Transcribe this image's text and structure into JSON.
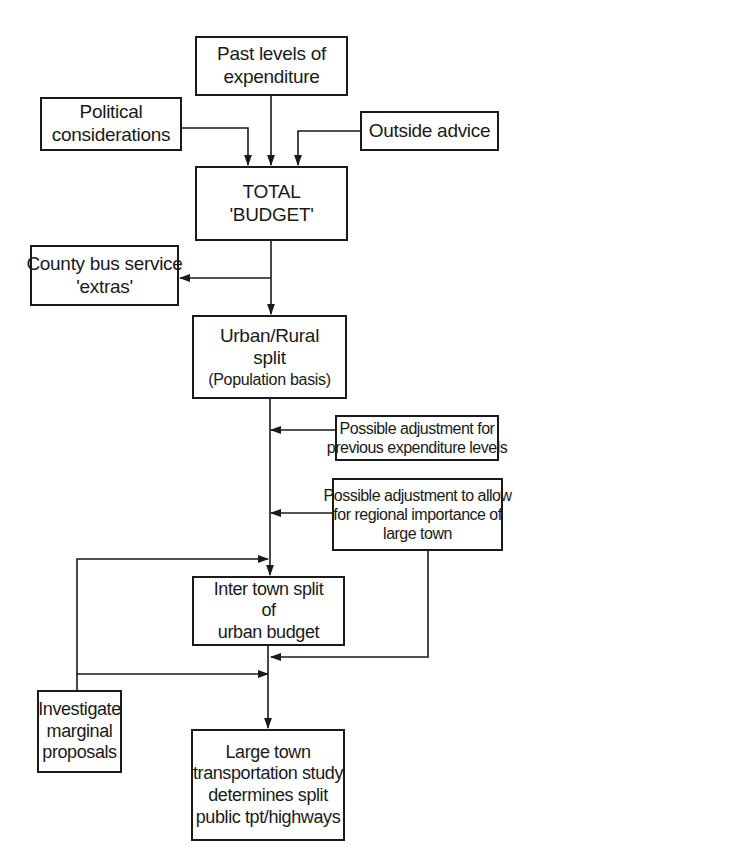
{
  "diagram": {
    "type": "flowchart",
    "nodes": {
      "past_levels": {
        "lines": [
          "Past levels of",
          "expenditure"
        ]
      },
      "political": {
        "lines": [
          "Political",
          "considerations"
        ]
      },
      "outside_advice": {
        "lines": [
          "Outside advice"
        ]
      },
      "total_budget": {
        "lines": [
          "TOTAL",
          "'BUDGET'"
        ]
      },
      "county_bus": {
        "lines": [
          "County bus service",
          "'extras'"
        ]
      },
      "urban_rural": {
        "lines": [
          "Urban/Rural",
          "split",
          "(Population basis)"
        ]
      },
      "adj_previous": {
        "lines": [
          "Possible adjustment for",
          "previous expenditure levels"
        ]
      },
      "adj_regional": {
        "lines": [
          "Possible adjustment to allow",
          "for regional importance of",
          "large town"
        ]
      },
      "inter_town": {
        "lines": [
          "Inter town split",
          "of",
          "urban budget"
        ]
      },
      "investigate": {
        "lines": [
          "Investigate",
          "marginal",
          "proposals"
        ]
      },
      "large_town": {
        "lines": [
          "Large town",
          "transportation study",
          "determines split",
          "public tpt/highways"
        ]
      }
    },
    "edges": [
      {
        "from": "past_levels",
        "to": "total_budget"
      },
      {
        "from": "political",
        "to": "total_budget"
      },
      {
        "from": "outside_advice",
        "to": "total_budget"
      },
      {
        "from": "total_budget",
        "to": "county_bus"
      },
      {
        "from": "total_budget",
        "to": "urban_rural"
      },
      {
        "from": "adj_previous",
        "to": "urban_rural-inter_town-link"
      },
      {
        "from": "adj_regional",
        "to": "urban_rural-inter_town-link"
      },
      {
        "from": "investigate",
        "to": "inter_town"
      },
      {
        "from": "urban_rural",
        "to": "inter_town"
      },
      {
        "from": "adj_regional",
        "to": "inter_town-large_town-link"
      },
      {
        "from": "investigate",
        "to": "inter_town-large_town-link"
      },
      {
        "from": "inter_town",
        "to": "large_town"
      }
    ],
    "line_color": "#1a1a1a",
    "background": "#ffffff"
  }
}
